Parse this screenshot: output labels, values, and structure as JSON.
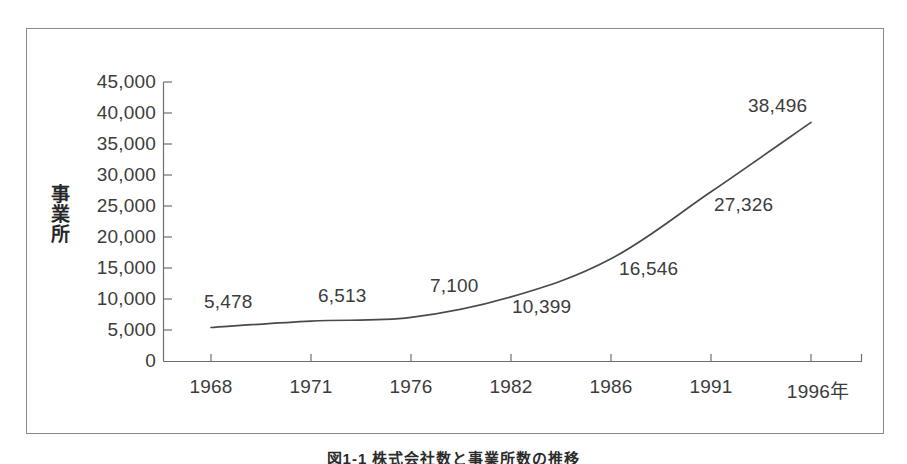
{
  "chart_data": {
    "type": "line",
    "title": "",
    "xlabel": "",
    "ylabel": "事業所",
    "x_unit_suffix": "年",
    "categories": [
      "1968",
      "1971",
      "1976",
      "1982",
      "1986",
      "1991",
      "1996年"
    ],
    "x_tick_labels": [
      "1968",
      "1971",
      "1976",
      "1982",
      "1986",
      "1991",
      "1996年"
    ],
    "values": [
      5478,
      6513,
      7100,
      10399,
      16546,
      27326,
      38496
    ],
    "point_labels": [
      "5,478",
      "6,513",
      "7,100",
      "10,399",
      "16,546",
      "27,326",
      "38,496"
    ],
    "y_tick_labels": [
      "45,000",
      "40,000",
      "35,000",
      "30,000",
      "25,000",
      "20,000",
      "15,000",
      "10,000",
      "5,000",
      "0"
    ],
    "y_tick_values": [
      45000,
      40000,
      35000,
      30000,
      25000,
      20000,
      15000,
      10000,
      5000,
      0
    ],
    "ylim": [
      0,
      45000
    ],
    "grid": false,
    "legend": false,
    "legend_position": "none",
    "line_color": "#4a4a4a",
    "axis_color": "#6f6f6f",
    "frame_color": "#8a8a8a",
    "text_color": "#3c3c3c"
  },
  "axis_title": {
    "char1": "事",
    "char2": "業",
    "char3": "所"
  },
  "caption": {
    "text": "図1-1 株式会社数と事業所数の推移"
  }
}
